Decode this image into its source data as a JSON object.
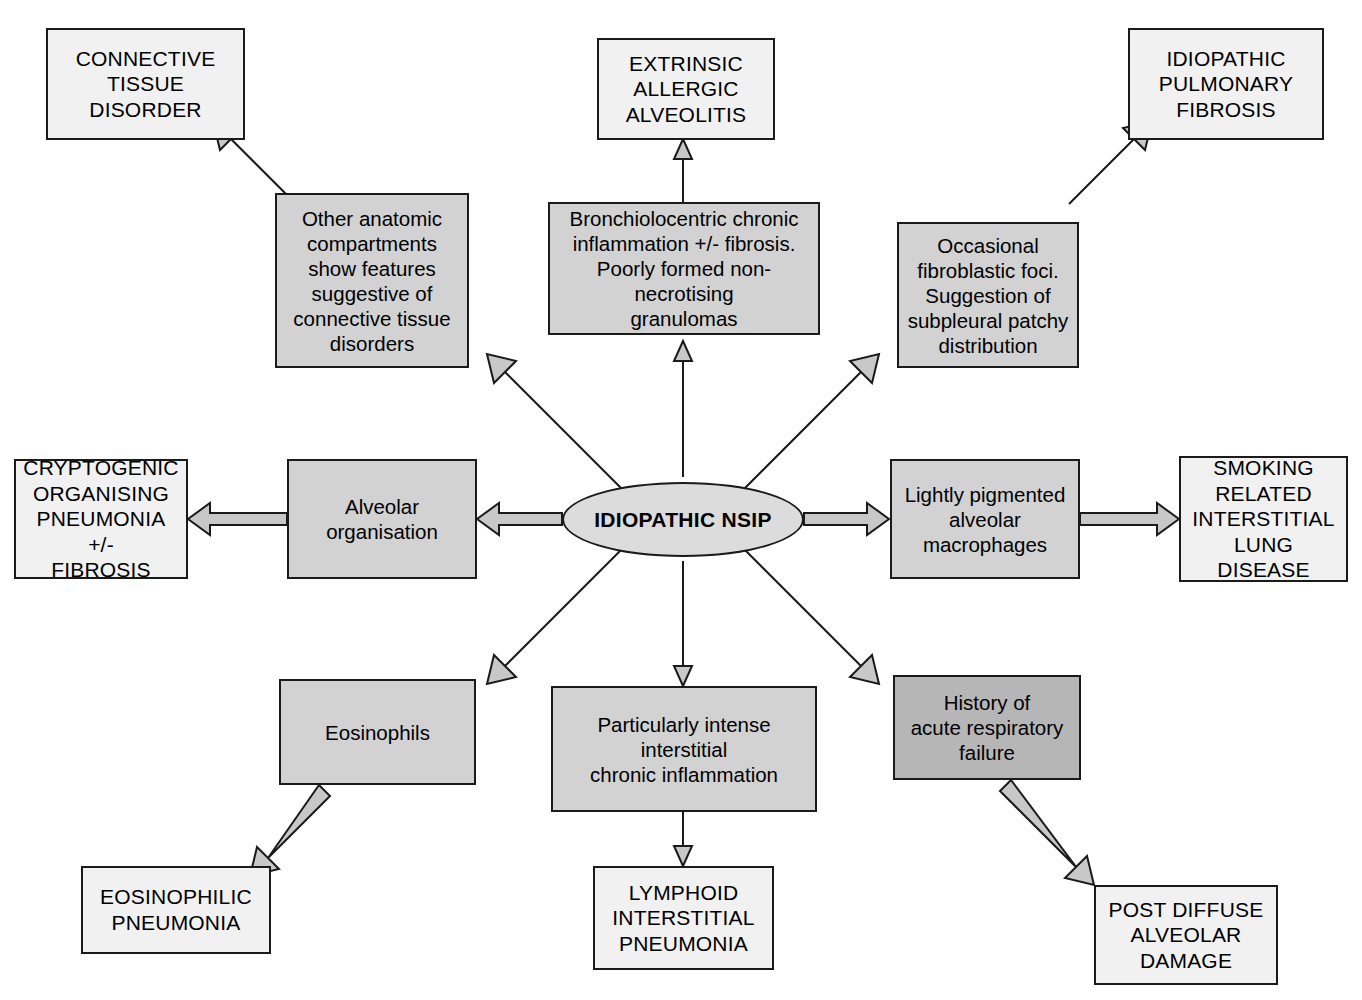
{
  "diagram": {
    "type": "radial-hub-and-spoke",
    "colors": {
      "outer_box_fill": "#f1f1f1",
      "inner_box_fill": "#d2d2d2",
      "inner_box_dark_fill": "#b6b6b6",
      "hub_fill": "#dcdcdc",
      "arrow_fill": "#c8c8c8",
      "stroke": "#1a1a1a",
      "background": "#ffffff"
    },
    "hub": {
      "label": "IDIOPATHIC NSIP"
    },
    "branches": [
      {
        "id": "connective-tissue",
        "feature": "Other anatomic\ncompartments\nshow features\nsuggestive of\nconnective tissue\ndisorders",
        "diagnosis": "CONNECTIVE\nTISSUE\nDISORDER",
        "direction": "upper-left"
      },
      {
        "id": "extrinsic-allergic-alveolitis",
        "feature": "Bronchiolocentric chronic\ninflammation +/- fibrosis.\nPoorly formed non-necrotising\ngranulomas",
        "diagnosis": "EXTRINSIC\nALLERGIC\nALVEOLITIS",
        "direction": "up"
      },
      {
        "id": "idiopathic-pulmonary-fibrosis",
        "feature": "Occasional\nfibroblastic foci.\nSuggestion of\nsubpleural patchy\ndistribution",
        "diagnosis": "IDIOPATHIC\nPULMONARY\nFIBROSIS",
        "direction": "upper-right"
      },
      {
        "id": "cryptogenic-organising-pneumonia",
        "feature": "Alveolar\norganisation",
        "diagnosis": "CRYPTOGENIC\nORGANISING\nPNEUMONIA +/-\nFIBROSIS",
        "direction": "left"
      },
      {
        "id": "smoking-related-ild",
        "feature": "Lightly pigmented\nalveolar\nmacrophages",
        "diagnosis": "SMOKING\nRELATED\nINTERSTITIAL\nLUNG DISEASE",
        "direction": "right"
      },
      {
        "id": "eosinophilic-pneumonia",
        "feature": "Eosinophils",
        "diagnosis": "EOSINOPHILIC\nPNEUMONIA",
        "direction": "lower-left"
      },
      {
        "id": "lymphoid-interstitial-pneumonia",
        "feature": "Particularly intense\ninterstitial\nchronic inflammation",
        "diagnosis": "LYMPHOID\nINTERSTITIAL\nPNEUMONIA",
        "direction": "down"
      },
      {
        "id": "post-diffuse-alveolar-damage",
        "feature": "History of\nacute respiratory\nfailure",
        "diagnosis": "POST DIFFUSE\nALVEOLAR\nDAMAGE",
        "direction": "lower-right"
      }
    ]
  }
}
